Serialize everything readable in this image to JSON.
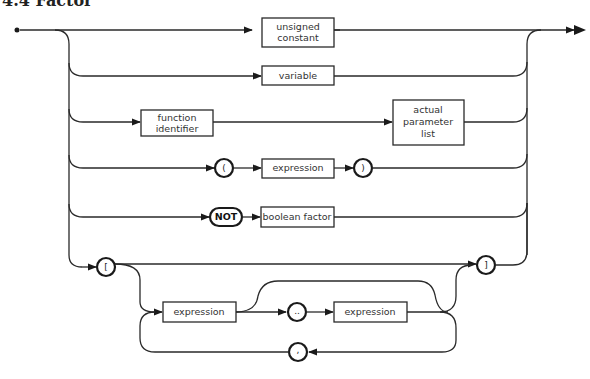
{
  "title": "4.4 Factor",
  "diagram": {
    "nonterminals": {
      "unsigned_constant": [
        "unsigned",
        "constant"
      ],
      "variable": "variable",
      "function_identifier": [
        "function",
        "identifier"
      ],
      "actual_parameter_list": [
        "actual",
        "parameter",
        "list"
      ],
      "expression_paren": "expression",
      "boolean_factor": "boolean factor",
      "expression_set_1": "expression",
      "expression_set_2": "expression"
    },
    "terminals": {
      "lparen": "(",
      "rparen": ")",
      "not": "NOT",
      "lbracket": "[",
      "rbracket": "]",
      "range": "..",
      "comma": ","
    },
    "stroke_color": "#2a2a2a",
    "background": "#ffffff"
  }
}
